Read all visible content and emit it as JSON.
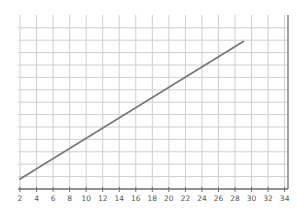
{
  "chart_data": {
    "type": "line",
    "title": "",
    "xlabel": "",
    "ylabel": "",
    "x_ticks": [
      2,
      4,
      6,
      8,
      10,
      12,
      14,
      16,
      18,
      20,
      22,
      24,
      26,
      28,
      30,
      32,
      34
    ],
    "xlim": [
      2,
      34.4
    ],
    "ylim": [
      0,
      14
    ],
    "y_tick_labels_visible": false,
    "grid": true,
    "legend": null,
    "series": [
      {
        "name": "line",
        "x": [
          2,
          29
        ],
        "y": [
          0.8,
          11.9
        ],
        "color": "#7a7a7a"
      }
    ]
  },
  "colors": {
    "grid": "#cfcfcf",
    "axis": "#6e6e6e",
    "line": "#7a7a7a",
    "right_border": "#8a8a8a"
  }
}
